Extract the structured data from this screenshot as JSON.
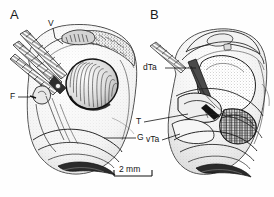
{
  "figure": {
    "kind": "scientific-line-drawing",
    "background_color": "#fefefe",
    "ink_color": "#1a1a1a"
  },
  "panels": [
    {
      "letter": "A",
      "description": "left view, oblique with segmented appendages and large striated lobe"
    },
    {
      "letter": "B",
      "description": "right view, showing internal cavities and tarsal structures"
    }
  ],
  "labels": [
    {
      "id": "v-label",
      "text": "V",
      "panel": "A"
    },
    {
      "id": "f-label",
      "text": "F",
      "panel": "A"
    },
    {
      "id": "g-label",
      "text": "G",
      "panel": "A"
    },
    {
      "id": "dta-label",
      "text": "dTa",
      "panel": "B"
    },
    {
      "id": "t-label",
      "text": "T",
      "panel": "B"
    },
    {
      "id": "vta-label",
      "text": "vTa",
      "panel": "B"
    }
  ],
  "scale_bar": {
    "text": "2 mm",
    "value": 2,
    "unit": "mm"
  }
}
